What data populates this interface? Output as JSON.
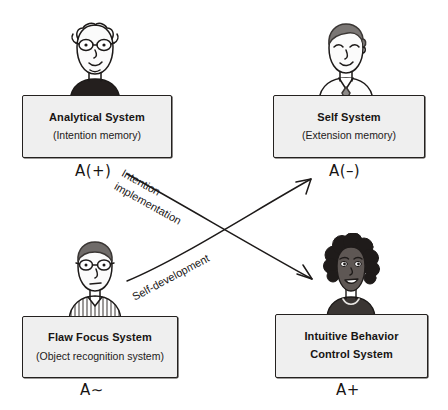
{
  "diagram": {
    "background_color": "#ffffff",
    "box_fill_color": "#efefef",
    "box_border_color": "#24211f",
    "ink_color": "#171413"
  },
  "systems": [
    {
      "id": "analytical",
      "position": "top-left",
      "title": "Analytical System",
      "subtitle": "(Intention memory)",
      "affect_code": "A(+)",
      "avatar_name": "avatar-bald-man-glasses"
    },
    {
      "id": "self",
      "position": "top-right",
      "title": "Self System",
      "subtitle": "(Extension memory)",
      "affect_code": "A(–)",
      "avatar_name": "avatar-man-necktie"
    },
    {
      "id": "flaw-focus",
      "position": "bottom-left",
      "title": "Flaw Focus System",
      "subtitle": "(Object recognition system)",
      "affect_code": "A∼",
      "avatar_name": "avatar-man-glasses-striped-shirt"
    },
    {
      "id": "intuitive-behavior",
      "position": "bottom-right",
      "title_line1": "Intuitive Behavior",
      "title_line2": "Control System",
      "subtitle": "",
      "affect_code": "A+",
      "avatar_name": "avatar-woman-curly-hair"
    }
  ],
  "arrows": [
    {
      "id": "intention-implementation",
      "label_line1": "Intention",
      "label_line2": "implementation",
      "from": "analytical",
      "to": "intuitive-behavior",
      "direction": "down-right"
    },
    {
      "id": "self-development",
      "label_line1": "Self-development",
      "label_line2": "",
      "from": "flaw-focus",
      "to": "self",
      "direction": "up-right"
    }
  ]
}
